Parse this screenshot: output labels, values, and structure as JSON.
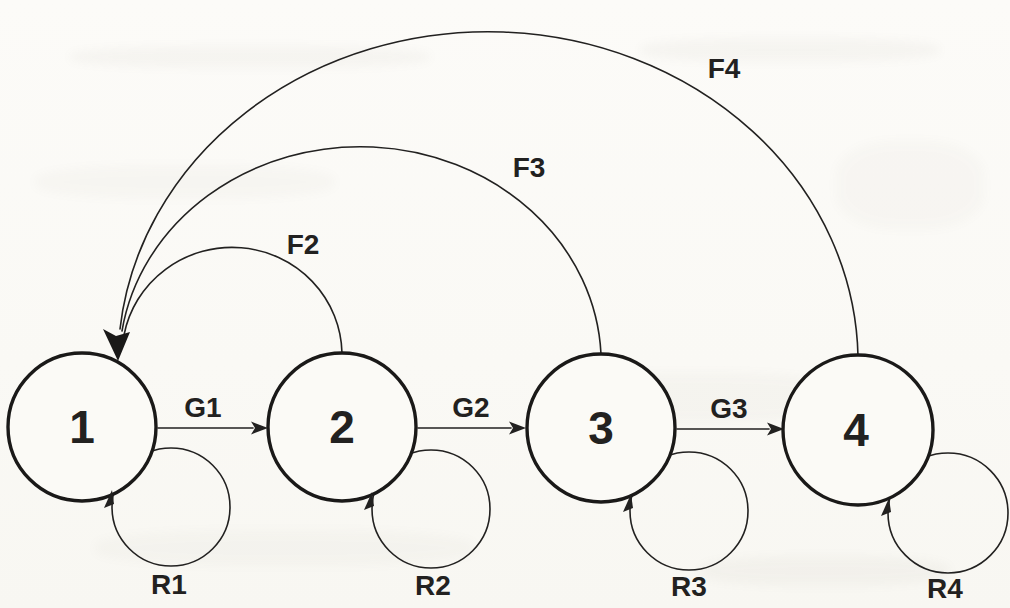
{
  "figure": {
    "type": "state-transition-diagram",
    "nodes": [
      {
        "id": "1",
        "label": "1"
      },
      {
        "id": "2",
        "label": "2"
      },
      {
        "id": "3",
        "label": "3"
      },
      {
        "id": "4",
        "label": "4"
      }
    ],
    "forward_edges": [
      {
        "label": "G1",
        "from": "1",
        "to": "2"
      },
      {
        "label": "G2",
        "from": "2",
        "to": "3"
      },
      {
        "label": "G3",
        "from": "3",
        "to": "4"
      }
    ],
    "feedback_edges": [
      {
        "label": "F2",
        "from": "2",
        "to": "1"
      },
      {
        "label": "F3",
        "from": "3",
        "to": "1"
      },
      {
        "label": "F4",
        "from": "4",
        "to": "1"
      }
    ],
    "self_loops": [
      {
        "label": "R1",
        "node": "1"
      },
      {
        "label": "R2",
        "node": "2"
      },
      {
        "label": "R3",
        "node": "3"
      },
      {
        "label": "R4",
        "node": "4"
      }
    ]
  },
  "colors": {
    "ink": "#222120",
    "node_stroke": "#1a1918",
    "paper": "#fbfaf6"
  }
}
